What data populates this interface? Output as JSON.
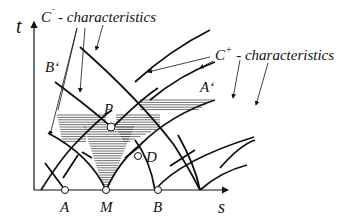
{
  "diagram": {
    "axis_labels": {
      "t": "t",
      "s": "s"
    },
    "labels": {
      "c_minus": "C⁻ - characteristics",
      "c_minus_base": "C",
      "c_minus_sup": "ˉ",
      "c_minus_text": " - characteristics",
      "c_plus_base": "C",
      "c_plus_sup": "+",
      "c_plus_text": " - characteristics",
      "B_prime": "B‘",
      "A_prime": "A‘",
      "P": "P",
      "D": "D",
      "A": "A",
      "M": "M",
      "B": "B"
    },
    "points": [
      "A",
      "M",
      "B",
      "P",
      "D"
    ],
    "colors": {
      "line": "#111111",
      "hatch": "#333333",
      "background": "#ffffff"
    }
  }
}
